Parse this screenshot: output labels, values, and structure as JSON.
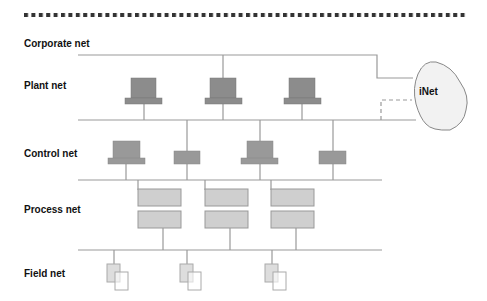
{
  "diagram": {
    "layers": [
      {
        "label": "Corporate net"
      },
      {
        "label": "Plant net"
      },
      {
        "label": "Control net"
      },
      {
        "label": "Process net"
      },
      {
        "label": "Field net"
      }
    ],
    "cloud": {
      "label": "iNet"
    },
    "colors": {
      "line": "#999999",
      "device_dark": "#8c8c8c",
      "device_mid": "#a8a8a8",
      "device_light": "#cfcfcf",
      "cloud_fill": "#f2f2f2",
      "dots": "#333333"
    }
  }
}
